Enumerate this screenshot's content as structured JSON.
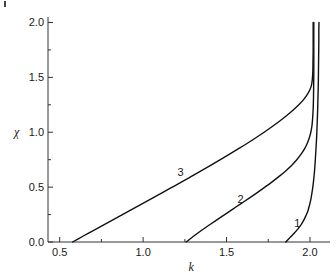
{
  "chart_data": {
    "type": "line",
    "title": "",
    "subtitle": "",
    "xlabel": "k",
    "ylabel": "χ",
    "xlim": [
      0.43,
      2.12
    ],
    "ylim": [
      0.0,
      2.05
    ],
    "grid": false,
    "legend": "inline-curve-labels",
    "x_ticks": [
      "0.5",
      "1.0",
      "1.5",
      "2.0"
    ],
    "x_tick_values": [
      0.5,
      1.0,
      1.5,
      2.0
    ],
    "x_minor_tick_values": [
      0.75,
      1.25,
      1.75
    ],
    "y_ticks": [
      "0.0",
      "0.5",
      "1.0",
      "1.5",
      "2.0"
    ],
    "y_tick_values": [
      0.0,
      0.5,
      1.0,
      1.5,
      2.0
    ],
    "y_minor_tick_values": [
      0.25,
      0.75,
      1.25,
      1.75
    ],
    "annotations": [
      {
        "text": "1",
        "x": 1.93,
        "y": 0.16
      },
      {
        "text": "2",
        "x": 1.59,
        "y": 0.38
      },
      {
        "text": "3",
        "x": 1.23,
        "y": 0.63
      }
    ],
    "series": [
      {
        "name": "1",
        "label": "1",
        "color": "#111111",
        "points": [
          [
            1.855,
            0.0
          ],
          [
            1.88,
            0.04
          ],
          [
            1.905,
            0.08
          ],
          [
            1.928,
            0.12
          ],
          [
            1.948,
            0.16
          ],
          [
            1.963,
            0.2
          ],
          [
            1.976,
            0.24
          ],
          [
            1.987,
            0.28
          ],
          [
            1.996,
            0.33
          ],
          [
            2.004,
            0.38
          ],
          [
            2.011,
            0.44
          ],
          [
            2.017,
            0.5
          ],
          [
            2.023,
            0.58
          ],
          [
            2.028,
            0.66
          ],
          [
            2.032,
            0.75
          ],
          [
            2.036,
            0.85
          ],
          [
            2.04,
            0.96
          ],
          [
            2.043,
            1.08
          ],
          [
            2.046,
            1.2
          ],
          [
            2.048,
            1.33
          ],
          [
            2.05,
            1.45
          ],
          [
            2.051,
            1.58
          ],
          [
            2.052,
            1.7
          ],
          [
            2.053,
            1.82
          ],
          [
            2.053,
            1.93
          ],
          [
            2.054,
            2.0
          ]
        ]
      },
      {
        "name": "2",
        "label": "2",
        "color": "#111111",
        "points": [
          [
            1.258,
            0.0
          ],
          [
            1.3,
            0.05
          ],
          [
            1.345,
            0.1
          ],
          [
            1.392,
            0.15
          ],
          [
            1.44,
            0.2
          ],
          [
            1.489,
            0.25
          ],
          [
            1.538,
            0.3
          ],
          [
            1.587,
            0.35
          ],
          [
            1.636,
            0.4
          ],
          [
            1.684,
            0.45
          ],
          [
            1.73,
            0.5
          ],
          [
            1.775,
            0.55
          ],
          [
            1.817,
            0.6
          ],
          [
            1.856,
            0.65
          ],
          [
            1.891,
            0.7
          ],
          [
            1.921,
            0.75
          ],
          [
            1.947,
            0.8
          ],
          [
            1.968,
            0.85
          ],
          [
            1.984,
            0.9
          ],
          [
            1.996,
            0.95
          ],
          [
            2.005,
            1.0
          ],
          [
            2.012,
            1.06
          ],
          [
            2.016,
            1.13
          ],
          [
            2.019,
            1.21
          ],
          [
            2.021,
            1.31
          ],
          [
            2.022,
            1.42
          ],
          [
            2.023,
            1.55
          ],
          [
            2.023,
            1.7
          ],
          [
            2.023,
            1.85
          ],
          [
            2.023,
            2.0
          ]
        ]
      },
      {
        "name": "3",
        "label": "3",
        "color": "#111111",
        "points": [
          [
            0.577,
            0.0
          ],
          [
            0.636,
            0.05
          ],
          [
            0.696,
            0.1
          ],
          [
            0.756,
            0.15
          ],
          [
            0.816,
            0.2
          ],
          [
            0.876,
            0.25
          ],
          [
            0.936,
            0.3
          ],
          [
            0.996,
            0.35
          ],
          [
            1.056,
            0.4
          ],
          [
            1.116,
            0.45
          ],
          [
            1.175,
            0.5
          ],
          [
            1.234,
            0.55
          ],
          [
            1.292,
            0.6
          ],
          [
            1.35,
            0.65
          ],
          [
            1.407,
            0.7
          ],
          [
            1.463,
            0.75
          ],
          [
            1.518,
            0.8
          ],
          [
            1.572,
            0.85
          ],
          [
            1.625,
            0.9
          ],
          [
            1.676,
            0.95
          ],
          [
            1.725,
            1.0
          ],
          [
            1.772,
            1.05
          ],
          [
            1.817,
            1.1
          ],
          [
            1.859,
            1.15
          ],
          [
            1.898,
            1.2
          ],
          [
            1.933,
            1.25
          ],
          [
            1.963,
            1.3
          ],
          [
            1.986,
            1.35
          ],
          [
            2.0,
            1.39
          ],
          [
            2.009,
            1.43
          ],
          [
            2.014,
            1.48
          ],
          [
            2.017,
            1.55
          ],
          [
            2.018,
            1.64
          ],
          [
            2.019,
            1.75
          ],
          [
            2.019,
            1.88
          ],
          [
            2.019,
            2.0
          ]
        ]
      }
    ]
  },
  "axes": {
    "y_axis_name": "chi-axis",
    "x_axis_name": "k-axis"
  }
}
